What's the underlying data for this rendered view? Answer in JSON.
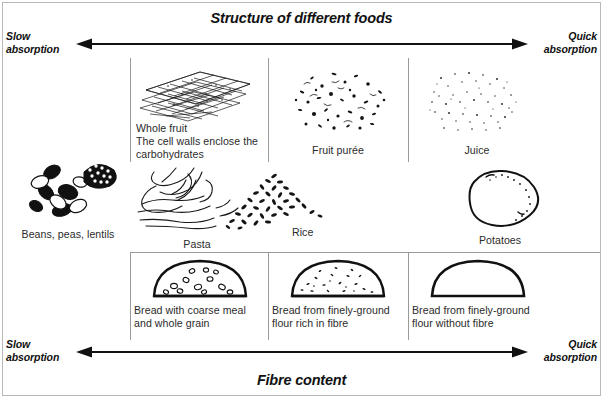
{
  "figure": {
    "top_title": "Structure of different foods",
    "bottom_title": "Fibre content"
  },
  "axes": {
    "top": {
      "left_label_line1": "Slow",
      "left_label_line2": "absorption",
      "right_label_line1": "Quick",
      "right_label_line2": "absorption",
      "direction": "double-headed-horizontal-arrow"
    },
    "bottom": {
      "left_label_line1": "Slow",
      "left_label_line2": "absorption",
      "right_label_line1": "Quick",
      "right_label_line2": "absorption",
      "direction": "double-headed-horizontal-arrow"
    }
  },
  "rows": [
    {
      "name": "fruit-row",
      "cells": [
        {
          "id": "whole-fruit",
          "caption": "Whole fruit\nThe cell walls enclose the\ncarbohydrates",
          "caption_align": "left",
          "art": "cell-wall-lattice-icon"
        },
        {
          "id": "fruit-puree",
          "caption": "Fruit purée",
          "caption_align": "center",
          "art": "coarse-speckle-blob-icon"
        },
        {
          "id": "juice",
          "caption": "Juice",
          "caption_align": "center",
          "art": "fine-speckle-blob-icon"
        }
      ]
    },
    {
      "name": "staples-row",
      "cells": [
        {
          "id": "beans-peas-lentils",
          "caption": "Beans, peas, lentils",
          "caption_align": "center",
          "art": "legumes-icon"
        },
        {
          "id": "pasta",
          "caption": "Pasta",
          "caption_align": "center",
          "art": "pasta-strands-icon"
        },
        {
          "id": "rice",
          "caption": "Rice",
          "caption_align": "center",
          "art": "rice-grains-icon"
        },
        {
          "id": "potatoes",
          "caption": "Potatoes",
          "caption_align": "center",
          "art": "potato-icon"
        }
      ]
    },
    {
      "name": "bread-row",
      "cells": [
        {
          "id": "bread-coarse-meal",
          "caption": "Bread with coarse meal\nand whole grain",
          "caption_align": "left",
          "art": "bread-loaf-coarse-icon"
        },
        {
          "id": "bread-fine-with-fibre",
          "caption": "Bread from finely-ground\nflour rich in fibre",
          "caption_align": "left",
          "art": "bread-loaf-speckled-icon"
        },
        {
          "id": "bread-fine-without-fibre",
          "caption": "Bread from finely-ground\nflour without fibre",
          "caption_align": "left",
          "art": "bread-loaf-plain-icon"
        }
      ]
    }
  ],
  "colors": {
    "ink": "#111111",
    "caption": "#2b2b2b",
    "rule": "#9a9a9a",
    "frame": "#b9b9b9",
    "background": "#ffffff"
  }
}
